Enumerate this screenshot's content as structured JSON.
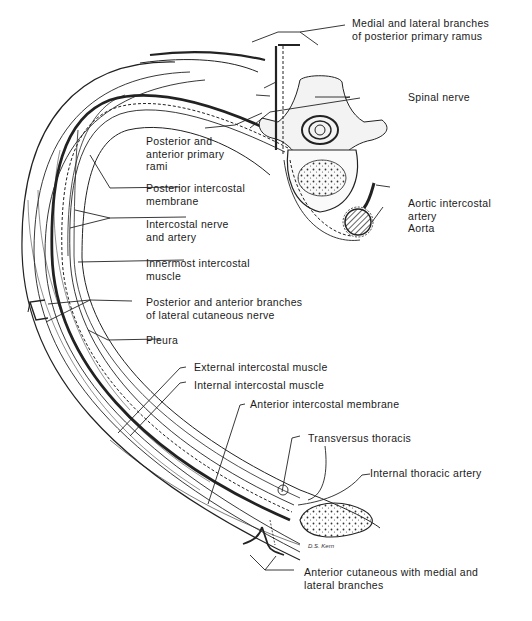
{
  "diagram": {
    "signature": "D.S. Kern",
    "labels": [
      {
        "id": "medial-lateral-branches",
        "lines": [
          "Medial and lateral branches",
          "of posterior primary ramus"
        ]
      },
      {
        "id": "spinal-nerve",
        "lines": [
          "Spinal nerve"
        ]
      },
      {
        "id": "posterior-anterior-rami",
        "lines": [
          "Posterior and",
          "anterior primary",
          "rami"
        ]
      },
      {
        "id": "posterior-intercostal-membrane",
        "lines": [
          "Posterior intercostal",
          "membrane"
        ]
      },
      {
        "id": "aortic-intercostal-artery",
        "lines": [
          "Aortic intercostal",
          "artery"
        ]
      },
      {
        "id": "aorta",
        "lines": [
          "Aorta"
        ]
      },
      {
        "id": "intercostal-nerve-artery",
        "lines": [
          "Intercostal nerve",
          "and artery"
        ]
      },
      {
        "id": "innermost-intercostal",
        "lines": [
          "Innermost intercostal",
          "muscle"
        ]
      },
      {
        "id": "lateral-cutaneous-branches",
        "lines": [
          "Posterior and anterior branches",
          "of lateral cutaneous nerve"
        ]
      },
      {
        "id": "pleura",
        "lines": [
          "Pleura"
        ]
      },
      {
        "id": "external-intercostal",
        "lines": [
          "External intercostal muscle"
        ]
      },
      {
        "id": "internal-intercostal",
        "lines": [
          "Internal  intercostal  muscle"
        ]
      },
      {
        "id": "anterior-intercostal-membrane",
        "lines": [
          "Anterior intercostal membrane"
        ]
      },
      {
        "id": "transversus-thoracis",
        "lines": [
          "Transversus thoracis"
        ]
      },
      {
        "id": "internal-thoracic-artery",
        "lines": [
          "Internal thoracic artery"
        ]
      },
      {
        "id": "anterior-cutaneous",
        "lines": [
          "Anterior cutaneous with medial and",
          "lateral branches"
        ]
      }
    ]
  }
}
